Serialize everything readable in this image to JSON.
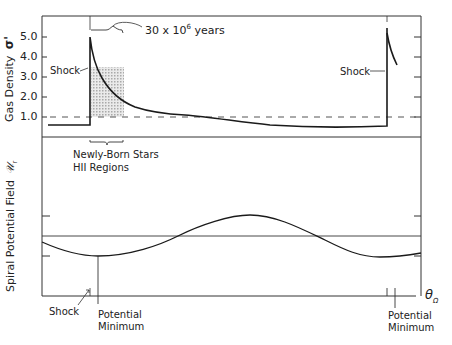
{
  "top_panel": {
    "y_label": "Gas Density",
    "y_symbol": "σ'",
    "y_ticks": [
      "5.0",
      "4.0",
      "3.0",
      "2.0",
      "1.0"
    ],
    "annotations": {
      "time_span": "30 x 10",
      "time_exp": "6",
      "time_unit": " years",
      "shock_left": "Shock",
      "shock_right": "Shock"
    },
    "reference_line": "1.0 (dashed)"
  },
  "middle_annotation": {
    "line1": "Newly-Born Stars",
    "line2": "HII Regions"
  },
  "bottom_panel": {
    "y_label": "Spiral Potential Field",
    "y_symbol": "𝒰",
    "y_symbol_sub": "r",
    "x_label": "θ",
    "x_label_sub": "Ω",
    "annotations": {
      "shock": "Shock",
      "potential_min_left_1": "Potential",
      "potential_min_left_2": "Minimum",
      "potential_min_right_1": "Potential",
      "potential_min_right_2": "Minimum"
    }
  },
  "colors": {
    "ink": "#1a1a1a",
    "frame": "#333333",
    "shade": "#c8c8c8"
  }
}
